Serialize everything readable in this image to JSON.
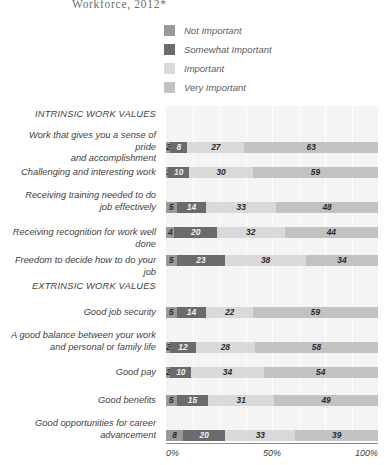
{
  "title": "Workforce, 2012*",
  "legend": {
    "position": "top",
    "items": [
      {
        "label": "Not Important",
        "color": "#9a9a9a"
      },
      {
        "label": "Somewhat Important",
        "color": "#6b6b6b"
      },
      {
        "label": "Important",
        "color": "#d9d9d9"
      },
      {
        "label": "Very Important",
        "color": "#c2c2c2"
      }
    ]
  },
  "axis": {
    "ticks": [
      "0%",
      "50%",
      "100%"
    ],
    "min": 0,
    "max": 100
  },
  "sections": [
    {
      "label": "INTRINSIC WORK VALUES"
    },
    {
      "label": "EXTRINSIC WORK VALUES"
    }
  ],
  "chart_data": {
    "type": "bar",
    "orientation": "horizontal",
    "stacked": true,
    "title": "Workforce, 2012*",
    "xlabel": "",
    "ylabel": "",
    "xlim": [
      0,
      100
    ],
    "grid": true,
    "legend_position": "top",
    "series": [
      {
        "name": "Not Important",
        "color": "#9a9a9a",
        "values": [
          2,
          1,
          5,
          4,
          5,
          5,
          2,
          2,
          5,
          8
        ]
      },
      {
        "name": "Somewhat Important",
        "color": "#6b6b6b",
        "values": [
          8,
          10,
          14,
          20,
          23,
          14,
          12,
          10,
          15,
          20
        ]
      },
      {
        "name": "Important",
        "color": "#d9d9d9",
        "values": [
          27,
          30,
          33,
          32,
          38,
          22,
          28,
          34,
          31,
          33
        ]
      },
      {
        "name": "Very Important",
        "color": "#c2c2c2",
        "values": [
          63,
          59,
          48,
          44,
          34,
          59,
          58,
          54,
          49,
          39
        ]
      }
    ],
    "categories": [
      "Work that gives you a sense of pride and accomplishment",
      "Challenging and interesting work",
      "Receiving training needed to do job effectively",
      "Receiving recognition for work well done",
      "Freedom to decide how to do your job",
      "Good job security",
      "A good balance between your work and personal or family life",
      "Good pay",
      "Good benefits",
      "Good opportunities for career advancement"
    ],
    "groups": [
      {
        "label": "INTRINSIC WORK VALUES",
        "categories": [
          0,
          1,
          2,
          3,
          4
        ]
      },
      {
        "label": "EXTRINSIC WORK VALUES",
        "categories": [
          5,
          6,
          7,
          8,
          9
        ]
      }
    ]
  },
  "rows": [
    {
      "kind": "section",
      "label": "INTRINSIC WORK VALUES"
    },
    {
      "kind": "bar",
      "label_line1": "Work that gives you a sense of pride",
      "label_line2": "and accomplishment",
      "values": [
        2,
        8,
        27,
        63
      ]
    },
    {
      "kind": "bar",
      "label_line1": "Challenging and interesting work",
      "label_line2": "",
      "values": [
        1,
        10,
        30,
        59
      ]
    },
    {
      "kind": "bar",
      "label_line1": "Receiving training needed to do",
      "label_line2": "job effectively",
      "values": [
        5,
        14,
        33,
        48
      ]
    },
    {
      "kind": "bar",
      "label_line1": "Receiving recognition for work well done",
      "label_line2": "",
      "values": [
        4,
        20,
        32,
        44
      ]
    },
    {
      "kind": "bar",
      "label_line1": "Freedom to decide how to do your job",
      "label_line2": "",
      "values": [
        5,
        23,
        38,
        34
      ]
    },
    {
      "kind": "section",
      "label": "EXTRINSIC WORK VALUES"
    },
    {
      "kind": "bar",
      "label_line1": "Good job security",
      "label_line2": "",
      "values": [
        5,
        14,
        22,
        59
      ]
    },
    {
      "kind": "bar",
      "label_line1": "A good balance between your work",
      "label_line2": "and personal or family life",
      "values": [
        2,
        12,
        28,
        58
      ]
    },
    {
      "kind": "bar",
      "label_line1": "Good pay",
      "label_line2": "",
      "values": [
        2,
        10,
        34,
        54
      ]
    },
    {
      "kind": "bar",
      "label_line1": "Good benefits",
      "label_line2": "",
      "values": [
        5,
        15,
        31,
        49
      ]
    },
    {
      "kind": "bar",
      "label_line1": "Good opportunities for career",
      "label_line2": "advancement",
      "values": [
        8,
        20,
        33,
        39
      ]
    }
  ]
}
